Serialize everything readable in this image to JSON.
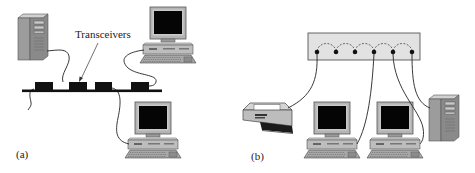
{
  "diagram": {
    "panels": [
      {
        "id": "a",
        "label": "(a)",
        "topology": "bus",
        "callout": "Transceivers",
        "bus": {
          "transceiver_count": 4
        },
        "devices": [
          {
            "type": "tower-server",
            "position": "top-left"
          },
          {
            "type": "desktop-computer",
            "position": "top-right"
          },
          {
            "type": "desktop-computer",
            "position": "bottom-right"
          }
        ]
      },
      {
        "id": "b",
        "label": "(b)",
        "topology": "hub",
        "hub": {
          "port_count": 6
        },
        "devices": [
          {
            "type": "printer",
            "position": "left"
          },
          {
            "type": "desktop-computer",
            "position": "center-left"
          },
          {
            "type": "desktop-computer",
            "position": "center-right"
          },
          {
            "type": "tower-server",
            "position": "right"
          }
        ]
      }
    ],
    "colors": {
      "line": "#222222",
      "screen": "#000000",
      "bezel": "#b0b0b0",
      "case": "#c8c8c8",
      "case_dark": "#8a8a8a",
      "hub_fill": "#e2e2e2",
      "transceiver": "#111111"
    }
  }
}
